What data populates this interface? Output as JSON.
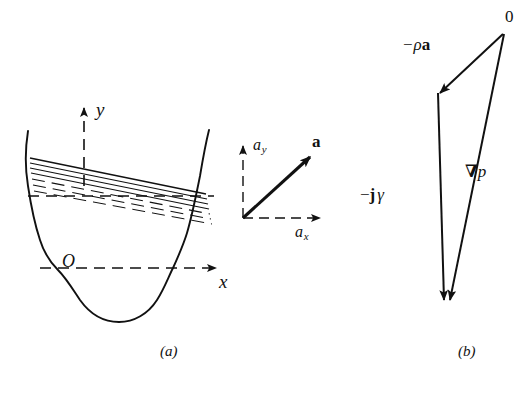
{
  "figure": {
    "domain": "Diagram",
    "width": 532,
    "height": 396,
    "background_color": "#ffffff",
    "ink_color": "#111111"
  },
  "panel_a": {
    "caption": "(a)",
    "axes": {
      "y_label": "y",
      "x_label": "x",
      "origin_label": "O",
      "style": "dashed axes with solid arrowheads"
    },
    "container": {
      "name": "vase-shaped-vessel",
      "style": "solid curved outline, open top, rounded wavy bottom"
    },
    "fluid_surface": {
      "name": "tilted-isobar-lines",
      "description": "Fan of parallel straight lines tilted downward to the right, representing constant-pressure surfaces in an accelerating fluid",
      "solid_line_count": 4,
      "dashed_line_count": 3
    },
    "acceleration_diagram": {
      "resultant_label": "a",
      "resultant_is_bold": true,
      "y_component_label": "a",
      "y_component_subscript": "y",
      "x_component_label": "a",
      "x_component_subscript": "x",
      "style": "solid bold resultant arrow, dashed component axes with solid arrowheads"
    }
  },
  "panel_b": {
    "caption": "(b)",
    "apex_label": "0",
    "vectors": [
      {
        "name": "minus-rho-a-vector",
        "label_prefix": "−ρ",
        "label_bold": "a",
        "direction": "from apex down-left, arrowhead at lower-left",
        "style": "solid thin line with filled arrowhead"
      },
      {
        "name": "minus-j-gamma-vector",
        "label_prefix": "−",
        "label_bold": "j",
        "label_suffix": "γ",
        "direction": "vertically downward, arrowhead at bottom",
        "style": "solid thin line with filled arrowhead"
      },
      {
        "name": "grad-p-vector",
        "label_bold": "∇",
        "label_suffix": "p",
        "direction": "from apex down and slightly left, arrowhead at bottom",
        "style": "solid thin line with filled arrowhead"
      }
    ],
    "shape": "closed vector triangle"
  }
}
